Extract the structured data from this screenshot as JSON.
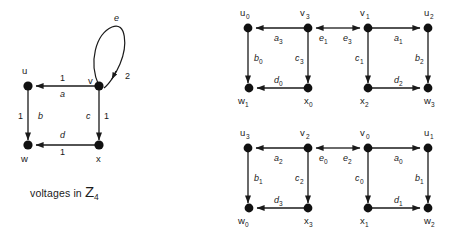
{
  "figure": {
    "caption_text": "voltages in ",
    "caption_group": "Z",
    "caption_group_sub": "4"
  },
  "base_graph": {
    "name": "voltage-graph",
    "vertices": [
      {
        "id": "u",
        "label": "u",
        "x": 28,
        "y": 86
      },
      {
        "id": "v",
        "label": "v",
        "x": 99,
        "y": 86
      },
      {
        "id": "w",
        "label": "w",
        "x": 28,
        "y": 145
      },
      {
        "id": "x",
        "label": "x",
        "x": 99,
        "y": 145
      }
    ],
    "edges": [
      {
        "id": "a",
        "label": "a",
        "voltage": "1",
        "from": "v",
        "to": "u"
      },
      {
        "id": "b",
        "label": "b",
        "voltage": "1",
        "from": "u",
        "to": "w"
      },
      {
        "id": "c",
        "label": "c",
        "voltage": "1",
        "from": "v",
        "to": "x"
      },
      {
        "id": "d",
        "label": "d",
        "voltage": "1",
        "from": "x",
        "to": "w"
      },
      {
        "id": "e",
        "label": "e",
        "voltage": "2",
        "from": "v",
        "to": "v"
      }
    ]
  },
  "derived_graph_top": {
    "name": "derived-graph-top",
    "vertices": [
      {
        "label": "u",
        "sub": "0",
        "x": 248,
        "y": 28
      },
      {
        "label": "v",
        "sub": "3",
        "x": 308,
        "y": 28
      },
      {
        "label": "v",
        "sub": "1",
        "x": 368,
        "y": 28
      },
      {
        "label": "u",
        "sub": "2",
        "x": 428,
        "y": 28
      },
      {
        "label": "w",
        "sub": "1",
        "x": 249,
        "y": 88
      },
      {
        "label": "x",
        "sub": "0",
        "x": 308,
        "y": 88
      },
      {
        "label": "x",
        "sub": "2",
        "x": 368,
        "y": 88
      },
      {
        "label": "w",
        "sub": "3",
        "x": 428,
        "y": 88
      }
    ],
    "edges": [
      {
        "label": "a",
        "sub": "3"
      },
      {
        "label": "b",
        "sub": "0"
      },
      {
        "label": "c",
        "sub": "3"
      },
      {
        "label": "d",
        "sub": "0"
      },
      {
        "label": "e",
        "sub": "1"
      },
      {
        "label": "e",
        "sub": "3"
      },
      {
        "label": "a",
        "sub": "1"
      },
      {
        "label": "b",
        "sub": "2"
      },
      {
        "label": "c",
        "sub": "1"
      },
      {
        "label": "d",
        "sub": "2"
      }
    ]
  },
  "derived_graph_bottom": {
    "name": "derived-graph-bottom",
    "vertices": [
      {
        "label": "u",
        "sub": "3",
        "x": 248,
        "y": 148
      },
      {
        "label": "v",
        "sub": "2",
        "x": 308,
        "y": 148
      },
      {
        "label": "v",
        "sub": "0",
        "x": 368,
        "y": 148
      },
      {
        "label": "u",
        "sub": "1",
        "x": 428,
        "y": 148
      },
      {
        "label": "w",
        "sub": "0",
        "x": 249,
        "y": 208
      },
      {
        "label": "x",
        "sub": "3",
        "x": 308,
        "y": 208
      },
      {
        "label": "x",
        "sub": "1",
        "x": 368,
        "y": 208
      },
      {
        "label": "w",
        "sub": "2",
        "x": 428,
        "y": 208
      }
    ],
    "edges": [
      {
        "label": "a",
        "sub": "2"
      },
      {
        "label": "b",
        "sub": "1"
      },
      {
        "label": "c",
        "sub": "2"
      },
      {
        "label": "d",
        "sub": "3"
      },
      {
        "label": "e",
        "sub": "0"
      },
      {
        "label": "e",
        "sub": "2"
      },
      {
        "label": "a",
        "sub": "0"
      },
      {
        "label": "b",
        "sub": "1"
      },
      {
        "label": "c",
        "sub": "0"
      },
      {
        "label": "d",
        "sub": "1"
      }
    ]
  },
  "colors": {
    "ink": "#1a1a1a",
    "node": "#111111",
    "background": "#ffffff"
  }
}
